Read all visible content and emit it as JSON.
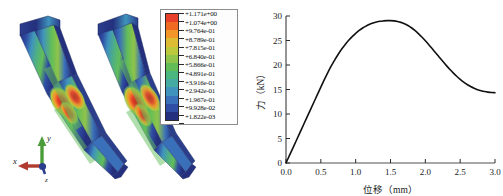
{
  "figure": {
    "panels": [
      {
        "name": "fem-simulation",
        "caption": ""
      },
      {
        "name": "force-displacement-plot",
        "caption": ""
      }
    ]
  },
  "fem": {
    "models": [
      {
        "id": "model-left",
        "label": ""
      },
      {
        "id": "model-right",
        "label": ""
      }
    ],
    "triad": {
      "x_label": "x",
      "y_label": "y",
      "z_label": "z",
      "x_color": "#b03a2e",
      "y_color": "#4a9c3a",
      "z_color": "#2b3e8c"
    },
    "legend": {
      "title": "",
      "values": [
        "+1.171e+00",
        "+1.074e+00",
        "+9.764e-01",
        "+8.789e-01",
        "+7.815e-01",
        "+6.840e-01",
        "+5.866e-01",
        "+4.891e-01",
        "+3.916e-01",
        "+2.942e-01",
        "+1.967e-01",
        "+9.928e-02",
        "+1.822e-03"
      ],
      "colors": [
        "#e8402a",
        "#f06a22",
        "#f2962a",
        "#ddbb33",
        "#bcc93c",
        "#90c44a",
        "#62bd59",
        "#49b77e",
        "#44aaa2",
        "#3f93bd",
        "#3a6fba",
        "#2f4da4",
        "#24307e"
      ]
    }
  },
  "chart_data": {
    "type": "line",
    "title": "",
    "xlabel": "位移（mm）",
    "ylabel": "力（kN）",
    "xlim": [
      0.0,
      3.0
    ],
    "ylim": [
      0,
      30
    ],
    "grid": false,
    "legend": null,
    "xticks": [
      "0.0",
      "0.5",
      "1.0",
      "1.5",
      "2.0",
      "2.5",
      "3.0"
    ],
    "xtick_values": [
      0.0,
      0.5,
      1.0,
      1.5,
      2.0,
      2.5,
      3.0
    ],
    "yticks": [
      "0",
      "5",
      "10",
      "15",
      "20",
      "25",
      "30"
    ],
    "ytick_values": [
      0,
      5,
      10,
      15,
      20,
      25,
      30
    ],
    "series": [
      {
        "name": "力-位移曲线",
        "color": "#111111",
        "x": [
          0.0,
          0.05,
          0.1,
          0.15,
          0.2,
          0.25,
          0.3,
          0.35,
          0.4,
          0.45,
          0.5,
          0.55,
          0.6,
          0.65,
          0.7,
          0.75,
          0.8,
          0.85,
          0.9,
          0.95,
          1.0,
          1.05,
          1.1,
          1.15,
          1.2,
          1.25,
          1.3,
          1.35,
          1.4,
          1.45,
          1.5,
          1.55,
          1.6,
          1.65,
          1.7,
          1.75,
          1.8,
          1.85,
          1.9,
          1.95,
          2.0,
          2.05,
          2.1,
          2.15,
          2.2,
          2.25,
          2.3,
          2.35,
          2.4,
          2.45,
          2.5,
          2.55,
          2.6,
          2.65,
          2.7,
          2.75,
          2.8,
          2.85,
          2.9,
          2.95,
          3.0
        ],
        "y": [
          0.0,
          1.55,
          3.1,
          4.65,
          6.2,
          7.75,
          9.3,
          10.85,
          12.4,
          13.95,
          15.5,
          17.0,
          18.45,
          19.8,
          21.05,
          22.2,
          23.25,
          24.2,
          25.05,
          25.8,
          26.45,
          27.05,
          27.55,
          27.95,
          28.3,
          28.58,
          28.78,
          28.92,
          29.0,
          29.05,
          29.05,
          29.0,
          28.88,
          28.7,
          28.42,
          28.05,
          27.6,
          27.05,
          26.42,
          25.72,
          24.95,
          24.15,
          23.3,
          22.45,
          21.6,
          20.75,
          19.92,
          19.12,
          18.38,
          17.7,
          17.08,
          16.52,
          16.02,
          15.6,
          15.25,
          14.97,
          14.75,
          14.58,
          14.46,
          14.38,
          14.35
        ],
        "peak": {
          "x": 1.47,
          "y": 29.05
        },
        "end": {
          "x": 3.0,
          "y": 14.35
        }
      }
    ]
  }
}
